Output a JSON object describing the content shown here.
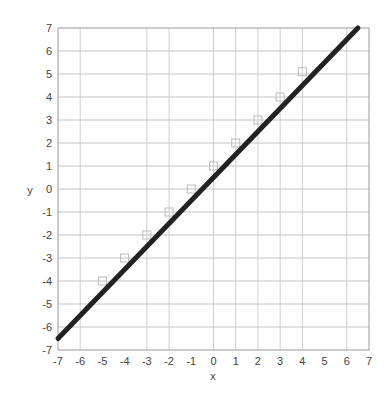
{
  "chart_data": {
    "type": "scatter",
    "title": "",
    "xlabel": "x",
    "ylabel": "y",
    "xlim": [
      -7,
      7
    ],
    "ylim": [
      -7,
      7
    ],
    "x_ticks": [
      -7,
      -6,
      -5,
      -4,
      -3,
      -2,
      -1,
      0,
      1,
      2,
      3,
      4,
      5,
      6,
      7
    ],
    "y_ticks": [
      7,
      6,
      5,
      4,
      3,
      2,
      1,
      0,
      -1,
      -2,
      -3,
      -4,
      -5,
      -6,
      -7
    ],
    "vertical_gridlines": [
      -6,
      -3,
      -2,
      0,
      1,
      2,
      3,
      4,
      6
    ],
    "horizontal_gridlines": [
      -6,
      -5,
      -4,
      -3,
      -2,
      -1,
      0,
      1,
      2,
      3,
      4,
      5,
      6
    ],
    "grid": true,
    "legend": null,
    "series": [
      {
        "name": "data points",
        "kind": "scatter",
        "marker": "open-square",
        "color": "#bbbbbb",
        "x": [
          -5,
          -4,
          -3,
          -2,
          -1,
          0,
          1,
          2,
          3,
          4
        ],
        "y": [
          -4,
          -3,
          -2,
          -1,
          0,
          1,
          2,
          3,
          4,
          5.1
        ]
      },
      {
        "name": "fit line",
        "kind": "line",
        "color": "#222222",
        "x": [
          -7,
          6.5
        ],
        "y": [
          -6.5,
          7
        ]
      }
    ]
  }
}
